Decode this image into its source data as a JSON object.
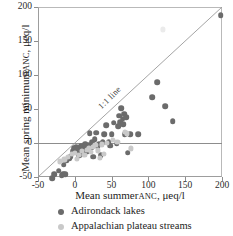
{
  "chart_data": {
    "type": "scatter",
    "title": "",
    "xlabel": "Mean summer ANC, μeq/l",
    "ylabel": "Mean spring minimum ANC, μeq/l",
    "xlabel_main": "Mean summer",
    "xlabel_sc": "ANC",
    "xlabel_tail": ", μeq/l",
    "ylabel_main": "Mean spring minimum",
    "ylabel_sc": "ANC",
    "ylabel_tail": ", μeq/l",
    "xlim": [
      -50,
      200
    ],
    "ylim": [
      -50,
      200
    ],
    "xticks": [
      -50,
      0,
      50,
      100,
      150,
      200
    ],
    "yticks": [
      -50,
      0,
      50,
      100,
      150,
      200
    ],
    "xticklabels": [
      "-50",
      "0",
      "50",
      "100",
      "150",
      "200"
    ],
    "yticklabels": [
      "-50",
      "0",
      "50",
      "100",
      "150",
      "200"
    ],
    "grid": false,
    "legend_position": "below-axis",
    "annotations": [
      {
        "text": "1:1 line",
        "x": 38,
        "y": 62,
        "rotation": -45
      }
    ],
    "reference_lines": [
      {
        "name": "one-to-one",
        "type": "diagonal",
        "from": [
          -50,
          -50
        ],
        "to": [
          200,
          200
        ],
        "color": "#9a9a9a"
      },
      {
        "name": "zero-horizontal",
        "type": "horizontal",
        "y": 0,
        "color": "#8d8d8d"
      }
    ],
    "series": [
      {
        "name": "Adirondack lakes",
        "color": "#6b6b6b",
        "marker": "circle",
        "points": [
          [
            -31,
            -52
          ],
          [
            -28,
            -46
          ],
          [
            -22,
            -41
          ],
          [
            -18,
            -47
          ],
          [
            -16,
            -45
          ],
          [
            -15,
            -32
          ],
          [
            -13,
            -46
          ],
          [
            -12,
            -26
          ],
          [
            -8,
            -22
          ],
          [
            -6,
            -20
          ],
          [
            -3,
            -12
          ],
          [
            -1,
            -8
          ],
          [
            1,
            -10
          ],
          [
            2,
            -6
          ],
          [
            3,
            -14
          ],
          [
            5,
            -7
          ],
          [
            6,
            -18
          ],
          [
            8,
            -4
          ],
          [
            9,
            -11
          ],
          [
            11,
            -5
          ],
          [
            12,
            -16
          ],
          [
            14,
            -2
          ],
          [
            15,
            -9
          ],
          [
            17,
            -13
          ],
          [
            19,
            -3
          ],
          [
            20,
            14
          ],
          [
            22,
            -7
          ],
          [
            24,
            1
          ],
          [
            25,
            -20
          ],
          [
            27,
            6
          ],
          [
            29,
            15
          ],
          [
            31,
            -5
          ],
          [
            33,
            -2
          ],
          [
            35,
            -18
          ],
          [
            38,
            1
          ],
          [
            40,
            13
          ],
          [
            43,
            26
          ],
          [
            46,
            1
          ],
          [
            48,
            -4
          ],
          [
            50,
            13
          ],
          [
            53,
            30
          ],
          [
            57,
            -1
          ],
          [
            59,
            25
          ],
          [
            60,
            40
          ],
          [
            62,
            31
          ],
          [
            63,
            51
          ],
          [
            65,
            36
          ],
          [
            66,
            28
          ],
          [
            67,
            43
          ],
          [
            68,
            13
          ],
          [
            70,
            38
          ],
          [
            72,
            -14
          ],
          [
            75,
            13
          ],
          [
            86,
            13
          ],
          [
            105,
            67
          ],
          [
            112,
            89
          ],
          [
            123,
            54
          ],
          [
            133,
            32
          ],
          [
            198,
            188
          ]
        ]
      },
      {
        "name": "Appalachian plateau streams",
        "color": "#c9c9c9",
        "marker": "circle",
        "points": [
          [
            -20,
            -27
          ],
          [
            -14,
            -24
          ],
          [
            -9,
            -21
          ],
          [
            -4,
            -16
          ],
          [
            0,
            -14
          ],
          [
            3,
            -23
          ],
          [
            6,
            -17
          ],
          [
            10,
            -12
          ],
          [
            13,
            -18
          ],
          [
            16,
            -10
          ],
          [
            19,
            -8
          ],
          [
            22,
            -13
          ],
          [
            25,
            -6
          ],
          [
            28,
            -3
          ],
          [
            31,
            -11
          ],
          [
            34,
            -22
          ],
          [
            37,
            -2
          ],
          [
            40,
            -16
          ],
          [
            44,
            0
          ],
          [
            52,
            4
          ],
          [
            58,
            2
          ],
          [
            68,
            16
          ],
          [
            71,
            14
          ],
          [
            76,
            -8
          ],
          [
            120,
            167
          ]
        ]
      }
    ]
  },
  "legend": {
    "items": [
      {
        "label": "Adirondack lakes",
        "marker": "dark"
      },
      {
        "label": "Appalachian plateau streams",
        "marker": "light"
      }
    ]
  }
}
